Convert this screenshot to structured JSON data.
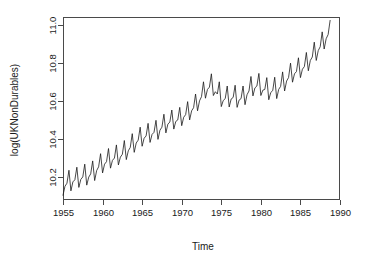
{
  "chart_data": {
    "type": "line",
    "title": "",
    "subtitle": "",
    "xlabel": "Time",
    "ylabel": "log(UKNonDurables)",
    "grid": false,
    "legend": false,
    "legend_position": "none",
    "xlim": [
      1955.0,
      1990.0
    ],
    "ylim": [
      10.08,
      11.04
    ],
    "xticks": [
      1955,
      1960,
      1965,
      1970,
      1975,
      1980,
      1985,
      1990
    ],
    "xtick_labels": [
      "1955",
      "1960",
      "1965",
      "1970",
      "1975",
      "1980",
      "1985",
      "1990"
    ],
    "yticks": [
      10.2,
      10.4,
      10.6,
      10.8,
      11.0
    ],
    "ytick_labels": [
      "10.2",
      "10.4",
      "10.6",
      "10.8",
      "11.0"
    ],
    "line_color": "#1a1a1a",
    "axis_color": "#4a4a4a",
    "background_color": "#ffffff",
    "series": [
      {
        "name": "log(UKNonDurables)",
        "frequency": "quarterly",
        "x_start": 1955.0,
        "x_step": 0.25,
        "x": [
          1955.0,
          1955.25,
          1955.5,
          1955.75,
          1956.0,
          1956.25,
          1956.5,
          1956.75,
          1957.0,
          1957.25,
          1957.5,
          1957.75,
          1958.0,
          1958.25,
          1958.5,
          1958.75,
          1959.0,
          1959.25,
          1959.5,
          1959.75,
          1960.0,
          1960.25,
          1960.5,
          1960.75,
          1961.0,
          1961.25,
          1961.5,
          1961.75,
          1962.0,
          1962.25,
          1962.5,
          1962.75,
          1963.0,
          1963.25,
          1963.5,
          1963.75,
          1964.0,
          1964.25,
          1964.5,
          1964.75,
          1965.0,
          1965.25,
          1965.5,
          1965.75,
          1966.0,
          1966.25,
          1966.5,
          1966.75,
          1967.0,
          1967.25,
          1967.5,
          1967.75,
          1968.0,
          1968.25,
          1968.5,
          1968.75,
          1969.0,
          1969.25,
          1969.5,
          1969.75,
          1970.0,
          1970.25,
          1970.5,
          1970.75,
          1971.0,
          1971.25,
          1971.5,
          1971.75,
          1972.0,
          1972.25,
          1972.5,
          1972.75,
          1973.0,
          1973.25,
          1973.5,
          1973.75,
          1974.0,
          1974.25,
          1974.5,
          1974.75,
          1975.0,
          1975.25,
          1975.5,
          1975.75,
          1976.0,
          1976.25,
          1976.5,
          1976.75,
          1977.0,
          1977.25,
          1977.5,
          1977.75,
          1978.0,
          1978.25,
          1978.5,
          1978.75,
          1979.0,
          1979.25,
          1979.5,
          1979.75,
          1980.0,
          1980.25,
          1980.5,
          1980.75,
          1981.0,
          1981.25,
          1981.5,
          1981.75,
          1982.0,
          1982.25,
          1982.5,
          1982.75,
          1983.0,
          1983.25,
          1983.5,
          1983.75,
          1984.0,
          1984.25,
          1984.5,
          1984.75,
          1985.0,
          1985.25,
          1985.5,
          1985.75,
          1986.0,
          1986.25,
          1986.5,
          1986.75,
          1987.0,
          1987.25,
          1987.5,
          1987.75,
          1988.0,
          1988.25,
          1988.5,
          1988.75
        ],
        "values": [
          10.105,
          10.152,
          10.168,
          10.236,
          10.128,
          10.175,
          10.186,
          10.252,
          10.146,
          10.188,
          10.201,
          10.268,
          10.158,
          10.2,
          10.217,
          10.285,
          10.182,
          10.234,
          10.254,
          10.323,
          10.222,
          10.268,
          10.281,
          10.35,
          10.247,
          10.288,
          10.3,
          10.369,
          10.264,
          10.305,
          10.32,
          10.392,
          10.292,
          10.338,
          10.356,
          10.428,
          10.33,
          10.379,
          10.394,
          10.462,
          10.362,
          10.404,
          10.416,
          10.482,
          10.382,
          10.424,
          10.435,
          10.498,
          10.398,
          10.446,
          10.462,
          10.53,
          10.432,
          10.478,
          10.489,
          10.552,
          10.452,
          10.492,
          10.5,
          10.566,
          10.47,
          10.514,
          10.528,
          10.596,
          10.5,
          10.548,
          10.564,
          10.636,
          10.548,
          10.6,
          10.622,
          10.7,
          10.614,
          10.66,
          10.672,
          10.742,
          10.628,
          10.648,
          10.636,
          10.7,
          10.57,
          10.602,
          10.612,
          10.678,
          10.568,
          10.61,
          10.618,
          10.682,
          10.566,
          10.604,
          10.612,
          10.678,
          10.58,
          10.632,
          10.652,
          10.728,
          10.626,
          10.668,
          10.678,
          10.744,
          10.628,
          10.656,
          10.66,
          10.722,
          10.606,
          10.644,
          10.654,
          10.724,
          10.612,
          10.66,
          10.676,
          10.752,
          10.652,
          10.704,
          10.722,
          10.798,
          10.698,
          10.742,
          10.754,
          10.826,
          10.722,
          10.766,
          10.78,
          10.854,
          10.758,
          10.812,
          10.83,
          10.908,
          10.812,
          10.864,
          10.884,
          10.962,
          10.872,
          10.926,
          10.948,
          11.022
        ]
      }
    ]
  },
  "axes": {
    "x_title": "Time",
    "y_title": "log(UKNonDurables)"
  }
}
